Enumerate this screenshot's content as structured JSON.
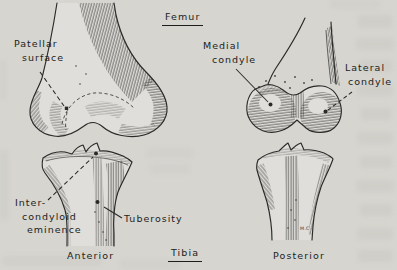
{
  "figure": {
    "colors": {
      "background": "#d6d5d0",
      "bone_fill": "#dfdeda",
      "ink": "#2a2a28",
      "text": "#1d1d1b",
      "smudge": "#c8c7c2"
    },
    "bone_titles": {
      "femur": "Femur",
      "tibia": "Tibia"
    },
    "view_captions": {
      "anterior": "Anterior",
      "posterior": "Posterior"
    },
    "labels": {
      "patellar_surface": {
        "lines": [
          "Patellar",
          "surface"
        ]
      },
      "medial_condyle": {
        "lines": [
          "Medial",
          "condyle"
        ]
      },
      "lateral_condyle": {
        "lines": [
          "Lateral",
          "condyle"
        ]
      },
      "intercondyloid_eminence": {
        "lines": [
          "Inter-",
          "condyloid",
          "eminence"
        ]
      },
      "tuberosity": {
        "lines": [
          "Tuberosity"
        ]
      }
    },
    "artist_signature": "M.C"
  }
}
